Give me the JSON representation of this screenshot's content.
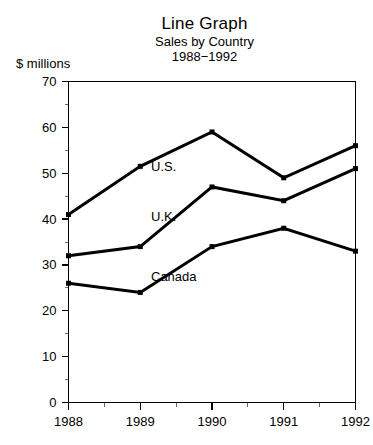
{
  "titles": {
    "main": "Line Graph",
    "sub1": "Sales by Country",
    "sub2": "1988−1992"
  },
  "axis_unit_label": "$ millions",
  "chart_data": {
    "type": "line",
    "title": "Line Graph",
    "subtitle": "Sales by Country",
    "period": "1988−1992",
    "xlabel": "",
    "ylabel": "$ millions",
    "categories": [
      "1988",
      "1989",
      "1990",
      "1991",
      "1992"
    ],
    "x": [
      1988,
      1989,
      1990,
      1991,
      1992
    ],
    "xlim": [
      1988,
      1992
    ],
    "ylim": [
      0,
      70
    ],
    "y_ticks": [
      0,
      10,
      20,
      30,
      40,
      50,
      60,
      70
    ],
    "y_minor_ticks": [
      5,
      15,
      25,
      35,
      45,
      55,
      65
    ],
    "x_minor_ticks": [
      1988.5,
      1989.5,
      1990.5,
      1991.5
    ],
    "grid": false,
    "legend": "inline-labels",
    "marker": "filled-square",
    "line_color": "#000000",
    "series": [
      {
        "name": "U.S.",
        "label": "U.S.",
        "values": [
          41,
          51.5,
          59,
          49,
          56
        ],
        "label_x": 1989.15,
        "label_y": 51.5
      },
      {
        "name": "U.K.",
        "label": "U.K.",
        "values": [
          32,
          34,
          47,
          44,
          51
        ],
        "label_x": 1989.15,
        "label_y": 40.5
      },
      {
        "name": "Canada",
        "label": "Canada",
        "values": [
          26,
          24,
          34,
          38,
          33
        ],
        "label_x": 1989.15,
        "label_y": 27.5
      }
    ]
  }
}
